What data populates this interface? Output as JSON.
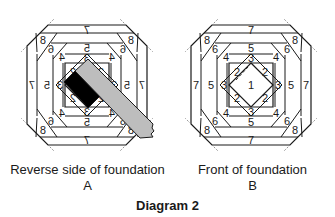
{
  "figure": {
    "title": "Diagram 2",
    "panels": [
      {
        "id": "A",
        "caption": "Reverse side of foundation",
        "letter": "A",
        "mirrored": true,
        "overlays": [
          {
            "name": "fabric-piece-dark",
            "color": "#000000"
          },
          {
            "name": "fabric-strip-light",
            "color": "#bdbdbd"
          }
        ]
      },
      {
        "id": "B",
        "caption": "Front of foundation",
        "letter": "B",
        "mirrored": false
      }
    ],
    "labels": {
      "center": "1",
      "ring2": "2",
      "ring3": "3",
      "ring4": "4",
      "ring5": "5",
      "ring6": "6",
      "ring7": "7",
      "ring8": "8"
    },
    "colors": {
      "line": "#1a1a1a",
      "dark_fabric": "#000000",
      "light_fabric": "#bdbdbd",
      "background": "#ffffff"
    }
  }
}
